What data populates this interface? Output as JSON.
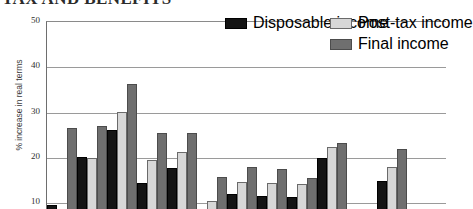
{
  "title": {
    "text": "TAX AND BENEFITS"
  },
  "axes": {
    "ylabel": "% increase in real terms",
    "yticks": [
      "50",
      "40",
      "30",
      "20",
      "10"
    ]
  },
  "legend": {
    "items": [
      {
        "label": "Disposable income",
        "color": "#141414"
      },
      {
        "label": "Post-tax income",
        "color": "#d7d7d7"
      },
      {
        "label": "Final income",
        "color": "#6f6f6f"
      }
    ]
  },
  "chart_data": {
    "type": "bar",
    "title": "TAX AND BENEFITS",
    "xlabel": "",
    "ylabel": "% increase in real terms",
    "ylim": [
      10,
      50
    ],
    "yticks": [
      10,
      20,
      30,
      40,
      50
    ],
    "grid": true,
    "legend_position": "top-right",
    "categories": [
      "1",
      "2",
      "3",
      "4",
      "5",
      "6",
      "7",
      "8",
      "9",
      "10",
      "",
      "11"
    ],
    "series": [
      {
        "name": "Disposable income",
        "color": "#141414",
        "values": [
          16.1,
          26.7,
          32.7,
          21.0,
          24.4,
          12.1,
          18.6,
          18.2,
          17.9,
          26.5,
          null,
          21.5
        ]
      },
      {
        "name": "Post-tax income",
        "color": "#d7d7d7",
        "values": [
          11.4,
          26.5,
          36.7,
          26.1,
          27.8,
          17.0,
          21.2,
          21.0,
          20.8,
          29.1,
          null,
          24.5
        ]
      },
      {
        "name": "Final income",
        "color": "#6f6f6f",
        "values": [
          33.1,
          33.7,
          43.0,
          32.0,
          32.1,
          22.4,
          24.6,
          24.1,
          22.2,
          29.9,
          null,
          28.5
        ]
      }
    ]
  }
}
